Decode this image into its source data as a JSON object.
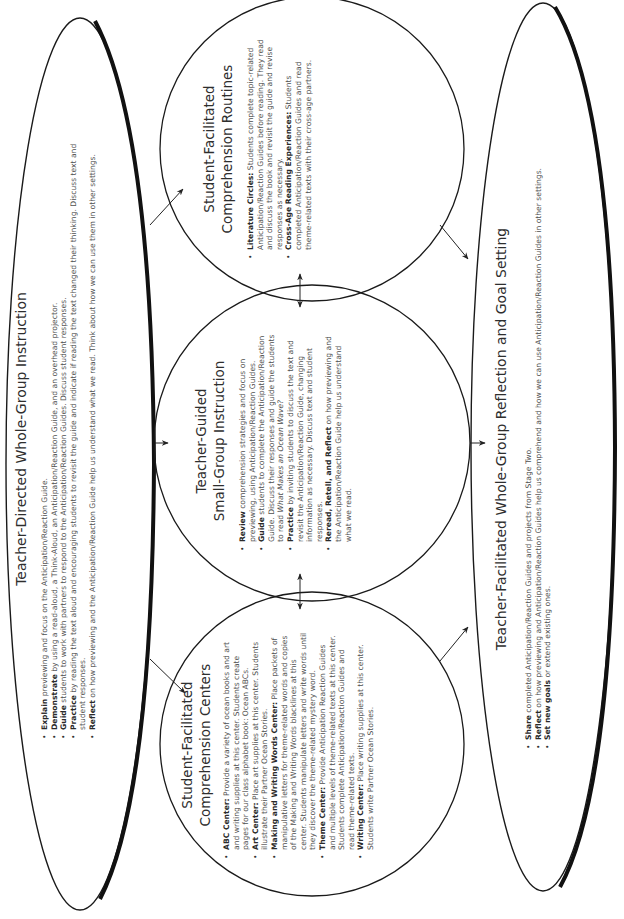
{
  "top_ellipse": {
    "title": "Teacher-Directed Whole-Group Instruction",
    "items": [
      {
        "key": "Explain",
        "text": " previewing and focus on the Anticipation/Reaction Guide."
      },
      {
        "key": "Demonstrate",
        "text": " by using a read-aloud, a Think-Aloud, an Anticipation/Reaction Guide, and an overhead projector."
      },
      {
        "key": "Guide",
        "text": " students to work with partners to respond to the Anticipation/Reaction Guides. Discuss student responses."
      },
      {
        "key": "Practice",
        "text": " by reading the text aloud and encouraging students to revisit the guide and indicate if reading the text changed their thinking. Discuss text and student responses."
      },
      {
        "key": "Reflect",
        "text": " on how previewing and the Anticipation/Reaction Guide help us understand what we read. Think about how we can use them in other settings."
      }
    ]
  },
  "circles": {
    "centers": {
      "title_line1": "Student-Facilitated",
      "title_line2": "Comprehension Centers",
      "items": [
        {
          "key": "ABC Center:",
          "text": " Provide a variety of ocean books and art and writing supplies at this center. Students create pages for our class alphabet book: Ocean ABCs."
        },
        {
          "key": "Art Center:",
          "text": " Place art supplies at this center. Students illustrate their Partner Ocean Stories."
        },
        {
          "key": "Making and Writing Words Center:",
          "text": " Place packets of manipulative letters for theme-related words and copies of the Making and Writing Words blacklines at this center. Students manipulate letters and write words until they discover the theme-related mystery word."
        },
        {
          "key": "Theme Center:",
          "text": " Provide Anticipation Reaction Guides and multiple levels of theme-related texts at this center. Students complete Anticipation/Reaction Guides and read theme-related texts."
        },
        {
          "key": "Writing Center:",
          "text": " Place writing supplies at this center. Students write Partner Ocean Stories."
        }
      ]
    },
    "small_group": {
      "title_line1": "Teacher-Guided",
      "title_line2": "Small-Group Instruction",
      "items": [
        {
          "key": "Review",
          "text": " comprehension strategies and focus on previewing, using Anticipation/Reaction Guides."
        },
        {
          "key": "Guide",
          "text": " students to complete the Anticipation/Reaction Guide. Discuss their responses and guide the students to read ",
          "italic": "What Makes an Ocean Wave?"
        },
        {
          "key": "Practice",
          "text": " by inviting students to discuss the text and revisit the Anticipation/Reaction Guide, changing information as necessary. Discuss text and student responses."
        },
        {
          "key": "Reread, Retell, and Reflect",
          "text": " on how previewing and the Anticipation/Reaction Guide help us understand what we read."
        }
      ]
    },
    "routines": {
      "title_line1": "Student-Facilitated",
      "title_line2": "Comprehension Routines",
      "items": [
        {
          "key": "Literature Circles:",
          "text": " Students complete topic-related Anticipation/Reaction Guides before reading. They read and discuss the book and revisit the guide and revise responses as necessary."
        },
        {
          "key": "Cross-Age Reading Experiences:",
          "text": " Students completed Anticipation/Reaction Guides and read theme-related texts with their cross-age partners."
        }
      ]
    }
  },
  "bottom_ellipse": {
    "title": "Teacher-Facilitated Whole-Group Reflection and Goal Setting",
    "items": [
      {
        "key": "Share",
        "text": " completed Anticipation/Reaction Guides and projects from Stage Two."
      },
      {
        "key": "Reflect",
        "text": " on how previewing and Anticipation/Reaction Guides help us comprehend and how we can use Anticipation/Reaction Guides in other settings."
      },
      {
        "key": "Set new goals",
        "text": " or extend existing ones."
      }
    ]
  },
  "colors": {
    "stroke": "#1a1a1a",
    "text": "#505050",
    "heading": "#2e2e2e"
  }
}
